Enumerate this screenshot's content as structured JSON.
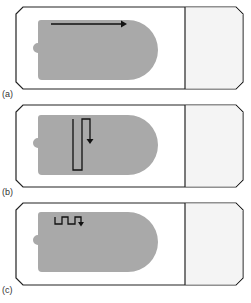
{
  "figure": {
    "colors": {
      "outline": "#222222",
      "slide_bg": "#ffffff",
      "label_area": "#f4f4f4",
      "specimen": "#a9a9a9",
      "path": "#111111"
    },
    "panels": [
      {
        "id": "a",
        "label": "(a)",
        "scan_pattern": "single-horizontal-stroke"
      },
      {
        "id": "b",
        "label": "(b)",
        "scan_pattern": "vertical-zigzag"
      },
      {
        "id": "c",
        "label": "(c)",
        "scan_pattern": "square-wave-meander"
      }
    ]
  }
}
